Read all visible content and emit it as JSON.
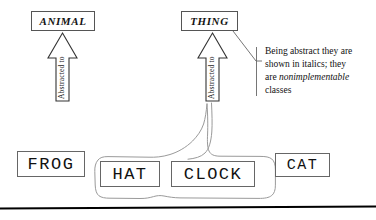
{
  "diagram": {
    "abstract_classes": [
      {
        "name": "ANIMAL",
        "label": "ANIMAL"
      },
      {
        "name": "THING",
        "label": "THING"
      }
    ],
    "concrete_classes": [
      {
        "name": "FROG",
        "label": "FROG"
      },
      {
        "name": "HAT",
        "label": "HAT"
      },
      {
        "name": "CLOCK",
        "label": "CLOCK"
      },
      {
        "name": "CAT",
        "label": "CAT"
      }
    ],
    "arrows": [
      {
        "name": "animal-arrow",
        "label": "Abstracted to"
      },
      {
        "name": "thing-arrow",
        "label": "Abstracted to"
      }
    ],
    "annotation": {
      "line1": "Being abstract they are",
      "line2": "shown in italics; they",
      "line3_prefix": "are ",
      "line3_emphasis": "nonimplementable",
      "line4": "classes"
    },
    "colors": {
      "background": "#ffffff",
      "box_stroke": "#555555",
      "concrete_stroke": "#666666",
      "arrow_stroke": "#333333",
      "callout_stroke": "#999999",
      "leader_stroke": "#666666",
      "rule_stroke": "#000000",
      "text": "#111111"
    }
  }
}
